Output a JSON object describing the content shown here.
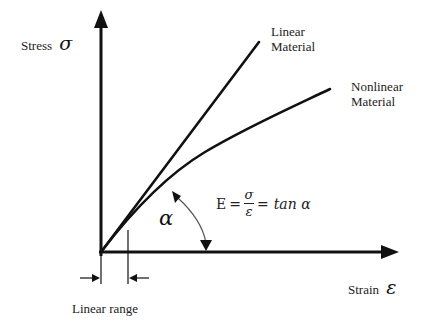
{
  "diagram": {
    "y_axis": {
      "label": "Stress",
      "symbol": "σ"
    },
    "x_axis": {
      "label": "Strain",
      "symbol": "ε"
    },
    "curves": [
      {
        "name": "linear",
        "label_line1": "Linear",
        "label_line2": "Material"
      },
      {
        "name": "nonlinear",
        "label_line1": "Nonlinear",
        "label_line2": "Material"
      }
    ],
    "angle": {
      "symbol": "α"
    },
    "formula": {
      "lhs": "E",
      "eq1": "=",
      "numerator": "σ",
      "denominator": "ε",
      "eq2": "=",
      "rhs": "tan α"
    },
    "range_marker": {
      "label": "Linear range"
    },
    "colors": {
      "stroke": "#111111",
      "arc": "#555555",
      "text": "#222222",
      "background": "#ffffff"
    }
  }
}
